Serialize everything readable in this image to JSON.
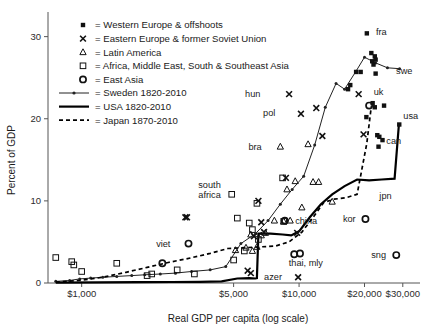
{
  "chart_data": {
    "type": "scatter",
    "title": "",
    "xlabel": "Real GDP per capita (log scale)",
    "ylabel": "Percent of GDP",
    "xscale": "log",
    "xlim": [
      700,
      36000
    ],
    "ylim": [
      0,
      33
    ],
    "yticks": [
      0,
      10,
      20,
      30
    ],
    "ytick_labels": [
      "0",
      "10",
      "20",
      "30"
    ],
    "xticks": [
      1000,
      5000,
      10000,
      20000,
      30000
    ],
    "xtick_labels": [
      "$1,000",
      "$5,000",
      "$10,000",
      "$20,000",
      "$30,000"
    ],
    "grid": false,
    "legend_position": "upper-left",
    "legend": [
      {
        "marker": "filled-square",
        "label": "= Western Europe & offshoots"
      },
      {
        "marker": "x-cross",
        "label": "= Eastern Europe & former Soviet Union"
      },
      {
        "marker": "triangle",
        "label": "= Latin America"
      },
      {
        "marker": "open-square",
        "label": "= Africa, Middle East, South & Southeast Asia"
      },
      {
        "marker": "circle",
        "label": "= East Asia"
      },
      {
        "marker": "line-dotted",
        "label": "= Sweden 1820-2010"
      },
      {
        "marker": "line-solid-thick",
        "label": "= USA 1820-2010"
      },
      {
        "marker": "line-dashed",
        "label": "= Japan 1870-2010"
      }
    ],
    "series": [
      {
        "name": "Sweden 1820-2010",
        "style": "line-with-dots",
        "points": [
          [
            760,
            0.2
          ],
          [
            880,
            0.3
          ],
          [
            980,
            0.5
          ],
          [
            1100,
            0.6
          ],
          [
            1250,
            0.7
          ],
          [
            1450,
            0.8
          ],
          [
            1700,
            0.9
          ],
          [
            1950,
            1.0
          ],
          [
            2300,
            1.1
          ],
          [
            2700,
            1.2
          ],
          [
            3200,
            1.4
          ],
          [
            3900,
            1.6
          ],
          [
            4600,
            2.0
          ],
          [
            5400,
            4.8
          ],
          [
            6300,
            6.0
          ],
          [
            7200,
            7.6
          ],
          [
            8200,
            9.6
          ],
          [
            9300,
            11.4
          ],
          [
            10500,
            13.0
          ],
          [
            11800,
            16.8
          ],
          [
            13200,
            21.4
          ],
          [
            14800,
            24.3
          ],
          [
            16200,
            23.6
          ],
          [
            18300,
            25.8
          ],
          [
            20000,
            27.5
          ],
          [
            22500,
            26.8
          ],
          [
            25500,
            26.2
          ],
          [
            29000,
            26.1
          ]
        ]
      },
      {
        "name": "USA 1820-2010",
        "style": "line-solid-thick",
        "points": [
          [
            760,
            0.05
          ],
          [
            1200,
            0.08
          ],
          [
            1800,
            0.1
          ],
          [
            2600,
            0.12
          ],
          [
            3500,
            0.15
          ],
          [
            4400,
            0.2
          ],
          [
            5200,
            0.55
          ],
          [
            5900,
            0.6
          ],
          [
            6300,
            0.55
          ],
          [
            6400,
            0.6
          ],
          [
            6500,
            6.0
          ],
          [
            7400,
            6.0
          ],
          [
            8400,
            5.9
          ],
          [
            9200,
            5.8
          ],
          [
            10000,
            6.3
          ],
          [
            11200,
            8.0
          ],
          [
            12600,
            9.6
          ],
          [
            14200,
            10.8
          ],
          [
            16200,
            11.8
          ],
          [
            18500,
            12.6
          ],
          [
            21000,
            12.5
          ],
          [
            24000,
            12.6
          ],
          [
            27500,
            12.7
          ],
          [
            28800,
            19.3
          ]
        ]
      },
      {
        "name": "Japan 1870-2010",
        "style": "line-dashed",
        "points": [
          [
            760,
            0.1
          ],
          [
            980,
            0.3
          ],
          [
            1250,
            0.7
          ],
          [
            1600,
            1.3
          ],
          [
            2000,
            1.9
          ],
          [
            2500,
            2.5
          ],
          [
            3100,
            3.0
          ],
          [
            3900,
            3.6
          ],
          [
            4700,
            4.2
          ],
          [
            5600,
            4.3
          ],
          [
            6600,
            4.4
          ],
          [
            7800,
            4.5
          ],
          [
            9000,
            5.0
          ],
          [
            10300,
            6.2
          ],
          [
            11600,
            8.0
          ],
          [
            13000,
            9.8
          ],
          [
            14500,
            10.2
          ],
          [
            16500,
            10.4
          ],
          [
            18500,
            10.8
          ],
          [
            20500,
            17.0
          ],
          [
            21500,
            21.5
          ]
        ]
      }
    ],
    "scatter_groups": [
      {
        "marker": "filled-square",
        "group": "Western Europe & offshoots",
        "points": [
          [
            20500,
            30.4
          ],
          [
            21500,
            28.0
          ],
          [
            21700,
            27.0
          ],
          [
            22300,
            27.6
          ],
          [
            22000,
            26.6
          ],
          [
            22500,
            27.2
          ],
          [
            18300,
            25.7
          ],
          [
            19200,
            25.7
          ],
          [
            22500,
            25.5
          ],
          [
            17200,
            24.1
          ],
          [
            16800,
            23.6
          ],
          [
            20400,
            20.2
          ],
          [
            21800,
            21.9
          ],
          [
            22300,
            21.4
          ],
          [
            24600,
            21.6
          ],
          [
            22900,
            18.0
          ],
          [
            23400,
            17.8
          ],
          [
            23200,
            16.6
          ],
          [
            28900,
            19.3
          ],
          [
            24200,
            17.4
          ]
        ]
      },
      {
        "marker": "x-cross",
        "group": "Eastern Europe & former Soviet Union",
        "points": [
          [
            9000,
            23.0
          ],
          [
            10200,
            20.6
          ],
          [
            12000,
            21.3
          ],
          [
            12800,
            17.9
          ],
          [
            18800,
            23.0
          ],
          [
            19800,
            18.1
          ],
          [
            8700,
            12.8
          ],
          [
            6500,
            10.0
          ],
          [
            6900,
            6.2
          ],
          [
            6200,
            5.7
          ],
          [
            3000,
            8.0
          ],
          [
            3050,
            8.0
          ],
          [
            5800,
            1.5
          ],
          [
            6000,
            1.2
          ],
          [
            9900,
            0.7
          ],
          [
            6700,
            7.4
          ],
          [
            9800,
            6.1
          ]
        ]
      },
      {
        "marker": "triangle",
        "group": "Latin America",
        "points": [
          [
            8200,
            16.6
          ],
          [
            11000,
            16.9
          ],
          [
            12300,
            12.3
          ],
          [
            9600,
            12.4
          ],
          [
            8800,
            11.4
          ],
          [
            10300,
            9.2
          ],
          [
            14200,
            9.9
          ],
          [
            7700,
            7.6
          ],
          [
            8500,
            7.5
          ],
          [
            7000,
            6.1
          ],
          [
            6700,
            5.8
          ],
          [
            6400,
            4.4
          ],
          [
            5700,
            4.3
          ],
          [
            5100,
            4.0
          ],
          [
            6100,
            3.9
          ],
          [
            9100,
            7.6
          ],
          [
            6000,
            5.9
          ],
          [
            11600,
            12.3
          ]
        ]
      },
      {
        "marker": "open-square",
        "group": "Africa, Middle East, South & Southeast Asia",
        "points": [
          [
            760,
            3.1
          ],
          [
            900,
            2.6
          ],
          [
            920,
            2.2
          ],
          [
            1000,
            1.4
          ],
          [
            1450,
            2.4
          ],
          [
            2100,
            1.1
          ],
          [
            2750,
            1.6
          ],
          [
            2000,
            0.9
          ],
          [
            3300,
            1.1
          ],
          [
            5200,
            7.9
          ],
          [
            5900,
            7.3
          ],
          [
            6400,
            9.7
          ],
          [
            4900,
            10.8
          ],
          [
            8400,
            12.8
          ],
          [
            6100,
            6.5
          ],
          [
            6500,
            5.3
          ],
          [
            5600,
            3.9
          ],
          [
            5000,
            2.8
          ],
          [
            8500,
            7.5
          ]
        ]
      },
      {
        "marker": "circle",
        "group": "East Asia",
        "points": [
          [
            3100,
            4.8
          ],
          [
            8600,
            7.6
          ],
          [
            9500,
            3.5
          ],
          [
            10100,
            3.6
          ],
          [
            21000,
            21.6
          ],
          [
            20200,
            7.8
          ],
          [
            28000,
            3.4
          ],
          [
            2350,
            2.4
          ]
        ]
      }
    ],
    "annotations": [
      {
        "text": "fra",
        "x": 21400,
        "y": 30.6,
        "align": "left"
      },
      {
        "text": "swe",
        "x": 26500,
        "y": 25.9,
        "align": "left"
      },
      {
        "text": "uk",
        "x": 20900,
        "y": 23.3,
        "align": "left"
      },
      {
        "text": "usa",
        "x": 28600,
        "y": 20.3,
        "align": "left"
      },
      {
        "text": "can",
        "x": 23900,
        "y": 17.3,
        "align": "left"
      },
      {
        "text": "hun",
        "x": 7000,
        "y": 23.1,
        "align": "right"
      },
      {
        "text": "pol",
        "x": 8200,
        "y": 20.7,
        "align": "right"
      },
      {
        "text": "bra",
        "x": 7100,
        "y": 16.6,
        "align": "right"
      },
      {
        "text": "south",
        "x": 4600,
        "y": 12.0,
        "align": "right"
      },
      {
        "text": "africa",
        "x": 4600,
        "y": 10.7,
        "align": "right"
      },
      {
        "text": "china",
        "x": 9100,
        "y": 7.6,
        "align": "left"
      },
      {
        "text": "viet",
        "x": 2700,
        "y": 4.8,
        "align": "right"
      },
      {
        "text": "thai, mly",
        "x": 8500,
        "y": 2.5,
        "align": "left"
      },
      {
        "text": "azer",
        "x": 8800,
        "y": 0.7,
        "align": "right"
      },
      {
        "text": "jpn",
        "x": 22200,
        "y": 10.6,
        "align": "left"
      },
      {
        "text": "kor",
        "x": 19200,
        "y": 7.8,
        "align": "right"
      },
      {
        "text": "sng",
        "x": 26500,
        "y": 3.4,
        "align": "right"
      }
    ]
  }
}
